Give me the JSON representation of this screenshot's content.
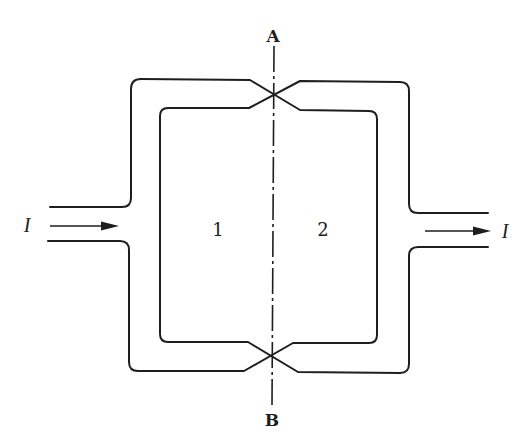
{
  "diagram": {
    "axis": {
      "top_label": "A",
      "bottom_label": "B",
      "style": "dash-dot"
    },
    "regions": [
      {
        "id": "left-loop",
        "label": "1"
      },
      {
        "id": "right-loop",
        "label": "2"
      }
    ],
    "current": {
      "input": {
        "label": "I",
        "direction": "right"
      },
      "output": {
        "label": "I",
        "direction": "right"
      }
    },
    "colors": {
      "line": "#1e1e1e",
      "background": "#ffffff"
    }
  }
}
